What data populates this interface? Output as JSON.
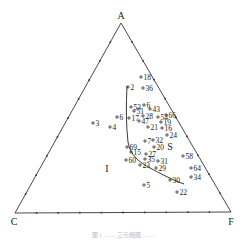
{
  "diagram": {
    "type": "ternary",
    "vertices": {
      "top": {
        "label": "A",
        "x": 121,
        "y": 23,
        "lx": 121,
        "ly": 19
      },
      "left": {
        "label": "C",
        "x": 15,
        "y": 213,
        "lx": 14,
        "ly": 225
      },
      "right": {
        "label": "F",
        "x": 231,
        "y": 212,
        "lx": 231,
        "ly": 225
      }
    },
    "field_labels": [
      {
        "label": "I",
        "x": 107,
        "y": 172
      },
      {
        "label": "S",
        "x": 170,
        "y": 150
      }
    ],
    "points": [
      {
        "label": "18",
        "x": 141,
        "y": 77
      },
      {
        "label": "2",
        "x": 128,
        "y": 87
      },
      {
        "label": "36",
        "x": 143,
        "y": 88
      },
      {
        "label": "53",
        "x": 131,
        "y": 107
      },
      {
        "label": "6",
        "x": 144,
        "y": 105
      },
      {
        "label": "43",
        "x": 150,
        "y": 109
      },
      {
        "label": "51",
        "x": 134,
        "y": 111
      },
      {
        "label": "3",
        "x": 93,
        "y": 123
      },
      {
        "label": "6",
        "x": 117,
        "y": 117
      },
      {
        "label": "4",
        "x": 110,
        "y": 127
      },
      {
        "label": "17",
        "x": 129,
        "y": 118
      },
      {
        "label": "47",
        "x": 139,
        "y": 121
      },
      {
        "label": "28",
        "x": 143,
        "y": 116
      },
      {
        "label": "54",
        "x": 158,
        "y": 117
      },
      {
        "label": "66",
        "x": 166,
        "y": 115
      },
      {
        "label": "19",
        "x": 161,
        "y": 122
      },
      {
        "label": "21",
        "x": 148,
        "y": 127
      },
      {
        "label": "16",
        "x": 162,
        "y": 128
      },
      {
        "label": "24",
        "x": 167,
        "y": 135
      },
      {
        "label": "7",
        "x": 145,
        "y": 141
      },
      {
        "label": "32",
        "x": 153,
        "y": 140
      },
      {
        "label": "69",
        "x": 127,
        "y": 147
      },
      {
        "label": "15",
        "x": 131,
        "y": 152
      },
      {
        "label": "20",
        "x": 154,
        "y": 147
      },
      {
        "label": "27",
        "x": 146,
        "y": 154
      },
      {
        "label": "58",
        "x": 183,
        "y": 156
      },
      {
        "label": "60",
        "x": 126,
        "y": 160
      },
      {
        "label": "35",
        "x": 145,
        "y": 159
      },
      {
        "label": "31",
        "x": 158,
        "y": 161
      },
      {
        "label": "23",
        "x": 140,
        "y": 165
      },
      {
        "label": "29",
        "x": 156,
        "y": 168
      },
      {
        "label": "64",
        "x": 191,
        "y": 168
      },
      {
        "label": "34",
        "x": 191,
        "y": 177
      },
      {
        "label": "30",
        "x": 170,
        "y": 180
      },
      {
        "label": "5",
        "x": 144,
        "y": 185
      },
      {
        "label": "22",
        "x": 177,
        "y": 192
      }
    ],
    "boundary_curve": "M127,86 C126,105 126,125 128,142 C130,155 140,163 150,168 C160,173 170,179 184,184",
    "ticks_per_side": 9,
    "caption": "图 1 …… 三元相图 ……"
  }
}
